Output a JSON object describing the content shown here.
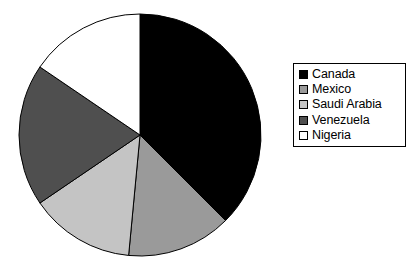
{
  "chart_data": {
    "type": "pie",
    "title": "",
    "subtitle": "",
    "xlabel": "",
    "ylabel": "",
    "grid": false,
    "legend_position": "right",
    "start_angle_deg": 0,
    "direction": "clockwise",
    "categories": [
      "Canada",
      "Mexico",
      "Saudi Arabia",
      "Venezuela",
      "Nigeria"
    ],
    "values": [
      37.5,
      14.0,
      14.0,
      19.0,
      15.5
    ],
    "units": "percent",
    "slice_colors": [
      "#000000",
      "#9a9a9a",
      "#c4c4c4",
      "#4f4f4f",
      "#ffffff"
    ],
    "slices": [
      {
        "label": "Canada",
        "value": 37.5,
        "color": "#000000",
        "start_deg": 0.0,
        "end_deg": 135.0
      },
      {
        "label": "Mexico",
        "value": 14.0,
        "color": "#9a9a9a",
        "start_deg": 135.0,
        "end_deg": 185.4
      },
      {
        "label": "Saudi Arabia",
        "value": 14.0,
        "color": "#c4c4c4",
        "start_deg": 185.4,
        "end_deg": 235.8
      },
      {
        "label": "Venezuela",
        "value": 19.0,
        "color": "#4f4f4f",
        "start_deg": 235.8,
        "end_deg": 304.2
      },
      {
        "label": "Nigeria",
        "value": 15.5,
        "color": "#ffffff",
        "start_deg": 304.2,
        "end_deg": 360.0
      }
    ],
    "geometry": {
      "cx": 140,
      "cy": 135,
      "r": 121,
      "stroke": "#000000",
      "stroke_width": 1
    }
  },
  "legend": {
    "items": [
      {
        "label": "Canada",
        "color": "#000000"
      },
      {
        "label": "Mexico",
        "color": "#9a9a9a"
      },
      {
        "label": "Saudi Arabia",
        "color": "#c4c4c4"
      },
      {
        "label": "Venezuela",
        "color": "#4f4f4f"
      },
      {
        "label": "Nigeria",
        "color": "#ffffff"
      }
    ]
  },
  "colors": {
    "background": "#ffffff",
    "outline": "#000000",
    "text": "#000000"
  }
}
